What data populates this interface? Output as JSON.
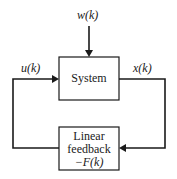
{
  "diagram": {
    "blocks": {
      "system": {
        "label": "System"
      },
      "feedback": {
        "line1": "Linear",
        "line2": "feedback",
        "line3": "−F(k)"
      }
    },
    "signals": {
      "disturbance": "w(k)",
      "input": "u(k)",
      "state": "x(k)"
    },
    "edges": [
      {
        "from": "w(k)",
        "to": "System"
      },
      {
        "from": "System",
        "to": "Linear feedback",
        "label": "x(k)"
      },
      {
        "from": "Linear feedback",
        "to": "System",
        "label": "u(k)"
      }
    ]
  }
}
